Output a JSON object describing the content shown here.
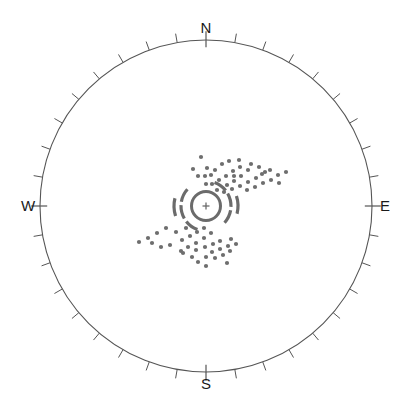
{
  "figure": {
    "kind": "polar-skyplot",
    "background_color": "#ffffff",
    "width": 412,
    "height": 413
  },
  "cardinals": {
    "north": "N",
    "east": "E",
    "south": "S",
    "west": "W"
  },
  "chart_data": {
    "type": "scatter",
    "projection": "polar",
    "title": "",
    "subtitle": "",
    "xlabel": "",
    "ylabel": "",
    "grid": false,
    "legend": null,
    "axis": {
      "angular_labels": [
        "N",
        "E",
        "S",
        "W"
      ],
      "angular_label_angles_deg": [
        0,
        90,
        180,
        270
      ],
      "angular_range_deg": [
        0,
        360
      ],
      "angular_tick_interval_deg": 10,
      "angular_tick_count": 36,
      "radial_range": [
        0,
        1
      ],
      "radial_ticks": [],
      "orientation": "N at top, E at right (clockwise azimuth)"
    },
    "style": {
      "outline_color": "#555555",
      "outline_width": 1.1,
      "tick_color": "#555555",
      "tick_length_minor": 9,
      "tick_length_cardinal": 16,
      "point_color": "#6e6e6e",
      "point_radius": 2.1,
      "marker_color": "#6b6b6b",
      "arc_color": "#6b6b6b"
    },
    "center_marker": {
      "shape": "circle-with-plus",
      "az_deg": 0,
      "r": 0,
      "outer_radius_px": 16,
      "ring_width_px": 3,
      "plus_size_px": 7,
      "color": "#6b6b6b"
    },
    "arc_segments": [
      {
        "radius_px": 25,
        "start_deg": 200,
        "end_deg": 232,
        "color": "#6b6b6b",
        "width": 3.2
      },
      {
        "radius_px": 25,
        "start_deg": 240,
        "end_deg": 272,
        "color": "#6b6b6b",
        "width": 3.2
      },
      {
        "radius_px": 25,
        "start_deg": 280,
        "end_deg": 312,
        "color": "#6b6b6b",
        "width": 3.2
      },
      {
        "radius_px": 25,
        "start_deg": 20,
        "end_deg": 52,
        "color": "#6b6b6b",
        "width": 3.2
      },
      {
        "radius_px": 25,
        "start_deg": 60,
        "end_deg": 92,
        "color": "#6b6b6b",
        "width": 3.2
      },
      {
        "radius_px": 25,
        "start_deg": 100,
        "end_deg": 132,
        "color": "#6b6b6b",
        "width": 3.2
      },
      {
        "radius_px": 32,
        "start_deg": 252,
        "end_deg": 284,
        "color": "#6b6b6b",
        "width": 3.2
      },
      {
        "radius_px": 32,
        "start_deg": 72,
        "end_deg": 104,
        "color": "#6b6b6b",
        "width": 3.2
      }
    ],
    "points_px": [
      [
        201,
        157
      ],
      [
        193,
        169
      ],
      [
        207,
        168
      ],
      [
        198,
        176
      ],
      [
        205,
        176
      ],
      [
        211,
        175
      ],
      [
        215,
        170
      ],
      [
        222,
        164
      ],
      [
        229,
        161
      ],
      [
        239,
        160
      ],
      [
        219,
        180
      ],
      [
        226,
        176
      ],
      [
        233,
        171
      ],
      [
        240,
        167
      ],
      [
        248,
        170
      ],
      [
        241,
        176
      ],
      [
        234,
        181
      ],
      [
        227,
        185
      ],
      [
        232,
        189
      ],
      [
        240,
        186
      ],
      [
        248,
        182
      ],
      [
        256,
        178
      ],
      [
        247,
        190
      ],
      [
        255,
        187
      ],
      [
        263,
        183
      ],
      [
        271,
        180
      ],
      [
        262,
        174
      ],
      [
        270,
        170
      ],
      [
        278,
        175
      ],
      [
        286,
        172
      ],
      [
        279,
        183
      ],
      [
        251,
        164
      ],
      [
        259,
        167
      ],
      [
        265,
        172
      ],
      [
        217,
        190
      ],
      [
        224,
        192
      ],
      [
        212,
        184
      ],
      [
        206,
        184
      ],
      [
        234,
        176
      ],
      [
        186,
        228
      ],
      [
        176,
        232
      ],
      [
        166,
        228
      ],
      [
        157,
        233
      ],
      [
        148,
        238
      ],
      [
        139,
        242
      ],
      [
        182,
        240
      ],
      [
        190,
        236
      ],
      [
        197,
        232
      ],
      [
        204,
        228
      ],
      [
        211,
        233
      ],
      [
        204,
        238
      ],
      [
        196,
        243
      ],
      [
        188,
        247
      ],
      [
        181,
        251
      ],
      [
        196,
        250
      ],
      [
        205,
        247
      ],
      [
        213,
        244
      ],
      [
        220,
        241
      ],
      [
        212,
        252
      ],
      [
        220,
        249
      ],
      [
        228,
        246
      ],
      [
        206,
        257
      ],
      [
        215,
        258
      ],
      [
        223,
        255
      ],
      [
        230,
        251
      ],
      [
        227,
        263
      ],
      [
        170,
        245
      ],
      [
        161,
        247
      ],
      [
        152,
        243
      ],
      [
        192,
        257
      ],
      [
        183,
        253
      ],
      [
        198,
        262
      ],
      [
        206,
        266
      ],
      [
        236,
        244
      ],
      [
        231,
        239
      ]
    ]
  }
}
